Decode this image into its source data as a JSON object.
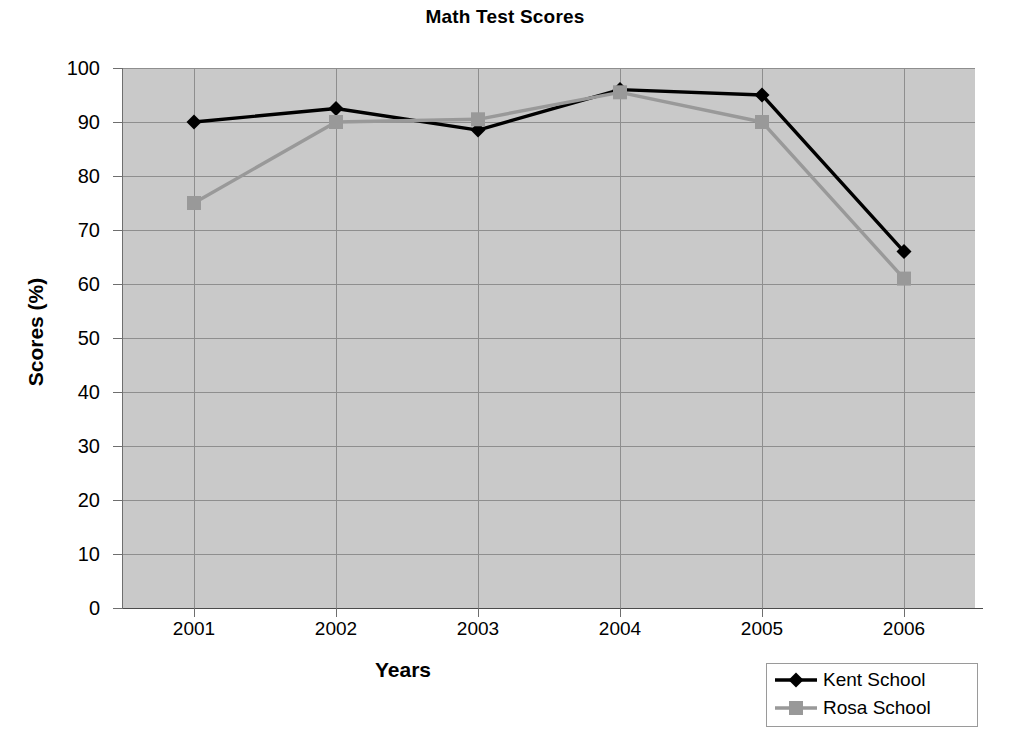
{
  "chart_data": {
    "type": "line",
    "title": "Math Test Scores",
    "xlabel": "Years",
    "ylabel": "Scores (%)",
    "categories": [
      "2001",
      "2002",
      "2003",
      "2004",
      "2005",
      "2006"
    ],
    "ylim": [
      0,
      100
    ],
    "yticks": [
      "0",
      "10",
      "20",
      "30",
      "40",
      "50",
      "60",
      "70",
      "80",
      "90",
      "100"
    ],
    "grid": true,
    "legend_position": "bottom-right",
    "series": [
      {
        "name": "Kent School",
        "color": "#000000",
        "marker": "diamond",
        "values": [
          90,
          92.5,
          88.5,
          96,
          95,
          66
        ]
      },
      {
        "name": "Rosa School",
        "color": "#999999",
        "marker": "square",
        "values": [
          75,
          90,
          90.5,
          95.5,
          90,
          61
        ]
      }
    ]
  },
  "plot_style": {
    "plot_background": "#c9c9c9",
    "gridline_color": "#8e8e8e",
    "axis_color": "#6e6e6e",
    "page_background": "#ffffff"
  }
}
